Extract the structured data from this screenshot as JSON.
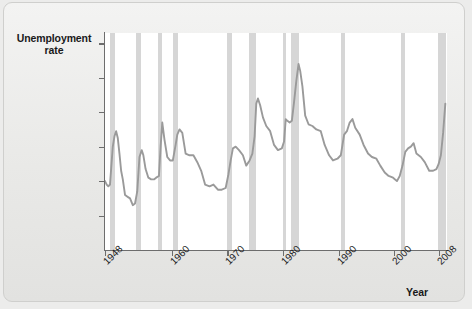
{
  "chart_data": {
    "type": "line",
    "title": "",
    "ylabel": "Unemployment\nrate",
    "ylabel_line1": "Unemployment",
    "ylabel_line2": "rate",
    "xlabel": "Year",
    "xlim": [
      1948,
      2009.5
    ],
    "ylim": [
      0,
      12.6
    ],
    "grid": false,
    "legend": "none",
    "line_color": "#9a9a9a",
    "recession_color": "#d2d2d2",
    "plot_background": "#ffffff",
    "figure_background": "#ececeb",
    "yticks": [
      {
        "value": 2,
        "label": "2"
      },
      {
        "value": 4,
        "label": "4"
      },
      {
        "value": 6,
        "label": "6"
      },
      {
        "value": 8,
        "label": "8"
      },
      {
        "value": 10,
        "label": "10"
      },
      {
        "value": 12,
        "label": "12%"
      }
    ],
    "xticks": [
      {
        "value": 1948,
        "label": "1948"
      },
      {
        "value": 1960,
        "label": "1960"
      },
      {
        "value": 1970,
        "label": "1970"
      },
      {
        "value": 1980,
        "label": "1980"
      },
      {
        "value": 1990,
        "label": "1990"
      },
      {
        "value": 2000,
        "label": "2000"
      },
      {
        "value": 2008,
        "label": "2008"
      }
    ],
    "recessions": [
      {
        "start": 1948.9,
        "end": 1949.8
      },
      {
        "start": 1953.5,
        "end": 1954.4
      },
      {
        "start": 1957.6,
        "end": 1958.3
      },
      {
        "start": 1960.3,
        "end": 1961.1
      },
      {
        "start": 1969.9,
        "end": 1970.9
      },
      {
        "start": 1973.9,
        "end": 1975.2
      },
      {
        "start": 1980.0,
        "end": 1980.5
      },
      {
        "start": 1981.5,
        "end": 1982.9
      },
      {
        "start": 1990.5,
        "end": 1991.2
      },
      {
        "start": 2001.2,
        "end": 2001.9
      },
      {
        "start": 2007.9,
        "end": 2009.4
      }
    ],
    "x": [
      1948.0,
      1948.3,
      1948.6,
      1948.9,
      1949.1,
      1949.4,
      1949.7,
      1950.0,
      1950.3,
      1950.6,
      1950.9,
      1951.2,
      1951.6,
      1952.0,
      1952.5,
      1953.0,
      1953.4,
      1953.8,
      1954.2,
      1954.6,
      1954.9,
      1955.3,
      1955.8,
      1956.3,
      1956.8,
      1957.2,
      1957.7,
      1958.0,
      1958.3,
      1958.7,
      1959.2,
      1959.7,
      1960.2,
      1960.7,
      1961.0,
      1961.4,
      1961.9,
      1962.5,
      1963.2,
      1963.9,
      1964.6,
      1965.3,
      1966.0,
      1966.8,
      1967.5,
      1968.3,
      1969.0,
      1969.7,
      1970.2,
      1970.6,
      1971.0,
      1971.5,
      1972.1,
      1972.8,
      1973.4,
      1974.0,
      1974.5,
      1974.9,
      1975.2,
      1975.5,
      1975.9,
      1976.4,
      1977.0,
      1977.7,
      1978.4,
      1979.1,
      1979.8,
      1980.2,
      1980.5,
      1980.8,
      1981.2,
      1981.6,
      1982.0,
      1982.4,
      1982.8,
      1983.1,
      1983.5,
      1984.0,
      1984.6,
      1985.3,
      1986.0,
      1986.8,
      1987.5,
      1988.3,
      1989.0,
      1989.8,
      1990.4,
      1991.0,
      1991.5,
      1992.0,
      1992.5,
      1993.0,
      1993.8,
      1994.5,
      1995.3,
      1996.0,
      1996.8,
      1997.5,
      1998.3,
      1999.0,
      1999.8,
      2000.5,
      2001.0,
      2001.5,
      2002.0,
      2002.5,
      2003.0,
      2003.5,
      2004.0,
      2004.8,
      2005.5,
      2006.3,
      2007.0,
      2007.6,
      2008.0,
      2008.4,
      2008.8,
      2009.2
    ],
    "y": [
      4.0,
      3.8,
      3.7,
      3.8,
      4.7,
      6.0,
      6.6,
      6.9,
      6.5,
      5.6,
      4.6,
      4.1,
      3.2,
      3.1,
      3.0,
      2.6,
      2.7,
      3.4,
      5.4,
      5.8,
      5.5,
      4.7,
      4.2,
      4.1,
      4.1,
      4.2,
      4.3,
      6.0,
      7.4,
      6.4,
      5.4,
      5.2,
      5.2,
      6.1,
      6.7,
      7.0,
      6.8,
      5.6,
      5.5,
      5.5,
      5.1,
      4.6,
      3.8,
      3.7,
      3.8,
      3.5,
      3.5,
      3.6,
      4.4,
      5.2,
      5.9,
      6.0,
      5.8,
      5.5,
      4.9,
      5.2,
      5.6,
      6.6,
      8.5,
      8.8,
      8.4,
      7.7,
      7.2,
      6.9,
      6.1,
      5.8,
      5.9,
      6.3,
      7.6,
      7.5,
      7.4,
      7.5,
      8.6,
      9.8,
      10.8,
      10.4,
      9.5,
      7.8,
      7.3,
      7.2,
      7.0,
      6.9,
      6.1,
      5.5,
      5.2,
      5.3,
      5.5,
      6.7,
      6.9,
      7.4,
      7.6,
      7.1,
      6.7,
      6.1,
      5.6,
      5.4,
      5.3,
      4.9,
      4.5,
      4.3,
      4.2,
      4.0,
      4.3,
      4.9,
      5.7,
      5.9,
      6.0,
      6.2,
      5.6,
      5.4,
      5.1,
      4.6,
      4.6,
      4.7,
      5.0,
      5.5,
      6.8,
      8.5
    ]
  }
}
